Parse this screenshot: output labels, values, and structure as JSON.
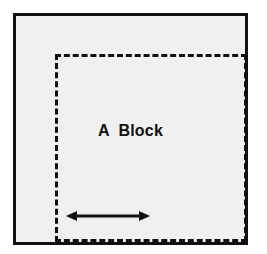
{
  "diagram": {
    "title": "A  Block",
    "outer_block": {
      "name": "outer-solid-block",
      "border_style": "solid",
      "border_color": "#111111",
      "border_width_px": 3,
      "fill_color": "#f0f0f0",
      "x": 13,
      "y": 13,
      "width": 235,
      "height": 232
    },
    "inner_region": {
      "name": "inner-dashed-region",
      "border_style": "dashed",
      "border_color": "#111111",
      "border_width_px": 3,
      "fill_color": "transparent",
      "x": 39,
      "y": 38,
      "width": 192,
      "height": 188
    },
    "label": {
      "text": "A  Block",
      "color": "#111111",
      "font_size_px": 16,
      "font_weight": "bold"
    },
    "arrow": {
      "name": "double-headed-arrow",
      "direction": "horizontal-bidirectional",
      "color": "#111111",
      "x": 50,
      "y": 190,
      "length_px": 84,
      "label": ""
    },
    "background_color": "#ffffff"
  }
}
